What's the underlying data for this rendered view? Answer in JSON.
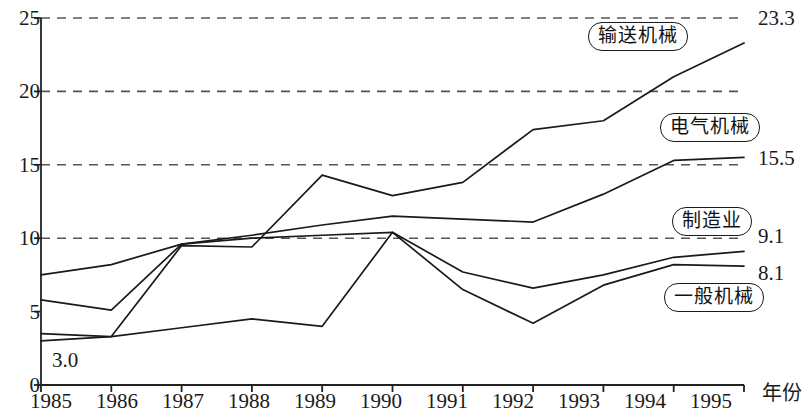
{
  "chart_data": {
    "type": "line",
    "title": "",
    "xlabel": "年份",
    "ylabel": "",
    "x": [
      1985,
      1986,
      1987,
      1988,
      1989,
      1990,
      1991,
      1992,
      1993,
      1994,
      1995
    ],
    "xtick_labels": [
      "1985",
      "1986",
      "1987",
      "1988",
      "1989",
      "1990",
      "1991",
      "1992",
      "1993",
      "1994",
      "1995"
    ],
    "ytick_labels": [
      "0",
      "5",
      "10",
      "15",
      "20",
      "25"
    ],
    "yticks": [
      0,
      5,
      10,
      15,
      20,
      25
    ],
    "ylim": [
      0,
      25
    ],
    "xlim": [
      1985,
      1995
    ],
    "grid": "horizontal-dashed",
    "gridlines": [
      10,
      15,
      20,
      25
    ],
    "legend_position": "inline-callouts",
    "series": [
      {
        "name": "输送机械",
        "values": [
          3.5,
          3.3,
          9.5,
          9.4,
          14.3,
          12.9,
          13.8,
          17.4,
          18.0,
          21.0,
          23.3
        ],
        "end_label": "23.3",
        "color": "#1a1a1a"
      },
      {
        "name": "电气机械",
        "values": [
          7.5,
          8.2,
          9.6,
          10.2,
          10.9,
          11.5,
          11.3,
          11.1,
          13.0,
          15.3,
          15.5
        ],
        "end_label": "15.5",
        "color": "#1a1a1a"
      },
      {
        "name": "制造业",
        "values": [
          5.8,
          5.1,
          9.6,
          10.0,
          10.2,
          10.4,
          7.7,
          6.6,
          7.5,
          8.7,
          9.1
        ],
        "end_label": "9.1",
        "color": "#1a1a1a"
      },
      {
        "name": "一般机械",
        "values": [
          3.0,
          3.3,
          3.9,
          4.5,
          4.0,
          10.4,
          6.5,
          4.2,
          6.8,
          8.2,
          8.1
        ],
        "start_label": "3.0",
        "end_label": "8.1",
        "color": "#1a1a1a"
      }
    ],
    "annotations": [
      {
        "text": "3.0",
        "kind": "start-value"
      },
      {
        "text": "23.3",
        "kind": "end-value"
      },
      {
        "text": "15.5",
        "kind": "end-value"
      },
      {
        "text": "9.1",
        "kind": "end-value"
      },
      {
        "text": "8.1",
        "kind": "end-value"
      }
    ]
  },
  "axis": {
    "y_labels": [
      "25",
      "20",
      "15",
      "10",
      "5",
      "0"
    ],
    "x_labels": [
      "1985",
      "1986",
      "1987",
      "1988",
      "1989",
      "1990",
      "1991",
      "1992",
      "1993",
      "1994",
      "1995"
    ],
    "x_title": "年份"
  },
  "callouts": {
    "transport": "输送机械",
    "electrical": "电气机械",
    "manufacturing": "制造业",
    "general": "一般机械"
  },
  "values": {
    "transport_end": "23.3",
    "electrical_end": "15.5",
    "manufacturing_end": "9.1",
    "general_end": "8.1",
    "general_start": "3.0"
  }
}
